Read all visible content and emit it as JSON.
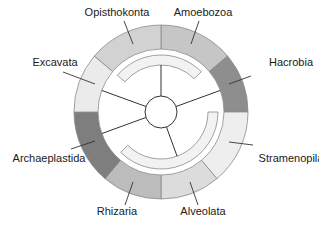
{
  "diagram": {
    "type": "eukaryote-supergroup-ring",
    "center": {
      "x": 161,
      "y": 112
    },
    "radii": {
      "outer": 87,
      "outer_inner": 63,
      "arc_outer": 57,
      "arc_inner": 47,
      "core": 16
    },
    "colors": {
      "stroke": "#8a8a8a",
      "line": "#333333",
      "arc_fill": "#f2f2f2"
    },
    "segments": [
      {
        "id": "amoebozoa",
        "label": "Amoebozoa",
        "start": 0,
        "end": 50,
        "fill": "#c6c6c6",
        "label_x": 203,
        "label_y": 16,
        "anchor": "middle",
        "leader": [
          199,
          21,
          191,
          44
        ]
      },
      {
        "id": "hacrobia",
        "label": "Hacrobia",
        "start": 50,
        "end": 90,
        "fill": "#8e8e8e",
        "label_x": 291,
        "label_y": 66,
        "anchor": "middle",
        "leader": [
          251,
          76,
          229,
          84
        ]
      },
      {
        "id": "stramenopila",
        "label": "Stramenopila",
        "start": 90,
        "end": 140,
        "fill": "#eeeeee",
        "label_x": 291,
        "label_y": 162,
        "anchor": "middle",
        "leader": [
          253,
          145,
          229,
          142
        ]
      },
      {
        "id": "alveolata",
        "label": "Alveolata",
        "start": 140,
        "end": 180,
        "fill": "#dcdcdc",
        "label_x": 203,
        "label_y": 215,
        "anchor": "middle",
        "leader": [
          198,
          205,
          190,
          182
        ]
      },
      {
        "id": "rhizaria",
        "label": "Rhizaria",
        "start": 180,
        "end": 220,
        "fill": "#bcbcbc",
        "label_x": 117,
        "label_y": 215,
        "anchor": "middle",
        "leader": [
          125,
          205,
          133,
          182
        ]
      },
      {
        "id": "archaeplastida",
        "label": "Archaeplastida",
        "start": 220,
        "end": 270,
        "fill": "#7e7e7e",
        "label_x": 49,
        "label_y": 162,
        "anchor": "middle",
        "leader": [
          71,
          149,
          95,
          141
        ]
      },
      {
        "id": "excavata",
        "label": "Excavata",
        "start": 270,
        "end": 310,
        "fill": "#ebebeb",
        "label_x": 55,
        "label_y": 66,
        "anchor": "middle",
        "leader": [
          63,
          72,
          95,
          84
        ]
      },
      {
        "id": "opisthokonta",
        "label": "Opisthokonta",
        "start": 310,
        "end": 360,
        "fill": "#d2d2d2",
        "label_x": 117,
        "label_y": 16,
        "anchor": "middle",
        "leader": [
          124,
          21,
          133,
          44
        ]
      }
    ],
    "inner_arcs": [
      {
        "id": "unikonts-arc",
        "start": 310,
        "end": 405
      },
      {
        "id": "bikonts-arc",
        "start": 90,
        "end": 225
      }
    ],
    "spokes": [
      0,
      70,
      160,
      250,
      290
    ]
  }
}
